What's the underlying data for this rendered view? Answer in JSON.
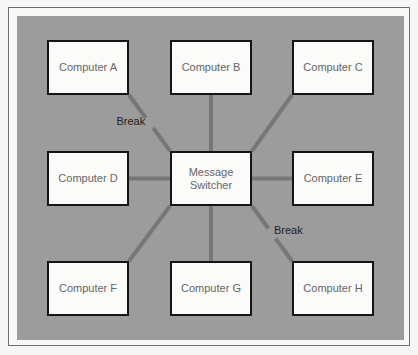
{
  "diagram": {
    "type": "star-network",
    "center": {
      "id": "switcher",
      "label": "Message\nSwitcher"
    },
    "nodes": [
      {
        "id": "A",
        "label": "Computer A",
        "row": 0,
        "col": 0,
        "link": "broken"
      },
      {
        "id": "B",
        "label": "Computer B",
        "row": 0,
        "col": 1,
        "link": "connected"
      },
      {
        "id": "C",
        "label": "Computer C",
        "row": 0,
        "col": 2,
        "link": "connected"
      },
      {
        "id": "D",
        "label": "Computer D",
        "row": 1,
        "col": 0,
        "link": "connected"
      },
      {
        "id": "E",
        "label": "Computer E",
        "row": 1,
        "col": 2,
        "link": "connected"
      },
      {
        "id": "F",
        "label": "Computer F",
        "row": 2,
        "col": 0,
        "link": "connected"
      },
      {
        "id": "G",
        "label": "Computer G",
        "row": 2,
        "col": 1,
        "link": "connected"
      },
      {
        "id": "H",
        "label": "Computer H",
        "row": 2,
        "col": 2,
        "link": "broken"
      }
    ],
    "break_label": "Break",
    "colors": {
      "panel": "#9c9c9c",
      "link": "#777777",
      "box": "#fbfbf9",
      "border": "#151515"
    }
  }
}
